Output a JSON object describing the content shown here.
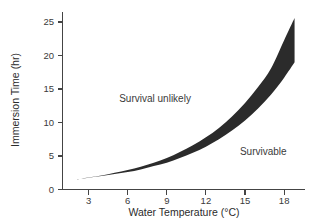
{
  "chart_data": {
    "type": "area",
    "title": "",
    "xlabel": "Water Temperature (°C)",
    "ylabel": "Immersion Time (hr)",
    "xlim": [
      1.0,
      19.6
    ],
    "ylim": [
      0,
      26.5
    ],
    "xticks": [
      3,
      6,
      9,
      12,
      15,
      18
    ],
    "xtick_labels": [
      "3",
      "6",
      "9",
      "12",
      "15",
      "18"
    ],
    "yticks": [
      0,
      5,
      10,
      15,
      20,
      25
    ],
    "ytick_labels": [
      "0",
      "5",
      "10",
      "15",
      "20",
      "25"
    ],
    "grid": false,
    "legend": null,
    "band_color": "#2b2b2b",
    "series": [
      {
        "name": "Upper boundary (survival unlikely above)",
        "x": [
          2.0,
          3.0,
          4.0,
          5.0,
          6.0,
          7.0,
          8.0,
          9.0,
          10.0,
          11.0,
          12.0,
          13.0,
          14.0,
          15.0,
          16.0,
          17.0,
          18.0,
          18.8
        ],
        "values": [
          1.5,
          1.8,
          2.1,
          2.5,
          2.9,
          3.4,
          4.0,
          4.7,
          5.6,
          6.6,
          7.8,
          9.2,
          10.9,
          12.9,
          15.3,
          18.1,
          22.3,
          25.6
        ]
      },
      {
        "name": "Lower boundary (survivable below)",
        "x": [
          2.0,
          3.0,
          4.0,
          5.0,
          6.0,
          7.0,
          8.0,
          9.0,
          10.0,
          11.0,
          12.0,
          13.0,
          14.0,
          15.0,
          16.0,
          17.0,
          18.0,
          18.8
        ],
        "values": [
          1.5,
          1.75,
          2.0,
          2.3,
          2.6,
          3.0,
          3.5,
          4.0,
          4.7,
          5.5,
          6.4,
          7.5,
          8.8,
          10.3,
          12.1,
          14.2,
          16.7,
          19.0
        ]
      }
    ],
    "annotations": [
      {
        "text": "Survival unlikely",
        "x": 8.1,
        "y": 13.0
      },
      {
        "text": "Survivable",
        "x": 16.4,
        "y": 5.2
      }
    ]
  }
}
